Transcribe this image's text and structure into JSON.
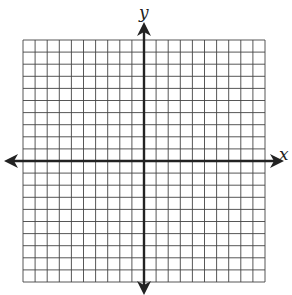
{
  "diagram": {
    "type": "coordinate-plane",
    "x_axis_label": "x",
    "y_axis_label": "y",
    "grid": {
      "columns": 20,
      "rows": 20,
      "left": 23,
      "top": 40,
      "cell_size": 12.1,
      "line_color": "#444444",
      "axis_color": "#222222"
    },
    "origin": {
      "col": 10,
      "row": 10
    }
  }
}
